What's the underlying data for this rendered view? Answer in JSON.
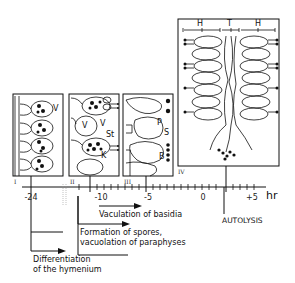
{
  "figure": {
    "panels": [
      {
        "id": "I",
        "labels": [
          "V"
        ]
      },
      {
        "id": "II",
        "labels": [
          "V",
          "V",
          "St",
          "K"
        ]
      },
      {
        "id": "III",
        "labels": [
          "P",
          "S",
          "B"
        ]
      },
      {
        "id": "IV",
        "labels": [
          "H",
          "T",
          "H"
        ]
      }
    ],
    "axis": {
      "unit": "hr",
      "ticks": [
        "-24",
        "-10",
        "-5",
        "0",
        "+5"
      ]
    },
    "events": [
      {
        "label": "AUTOLYSIS"
      },
      {
        "label": "Vaculation of basidia"
      },
      {
        "label_line1": "Formation of spores,",
        "label_line2": "vacuolation of paraphyses"
      },
      {
        "label_line1": "Differentiation",
        "label_line2": "of the hymenium"
      }
    ]
  }
}
